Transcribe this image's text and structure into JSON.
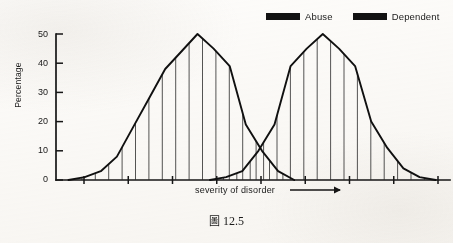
{
  "figure": {
    "caption_prefix": "圖",
    "caption_number": "12.5"
  },
  "legend": {
    "position": "top-right",
    "entries": [
      {
        "label": "Abuse",
        "color": "#121212",
        "swatch": "legend-swatch-rect"
      },
      {
        "label": "Dependent",
        "color": "#121212",
        "swatch": "legend-swatch-rect"
      }
    ]
  },
  "axes": {
    "y_title": "Percentage",
    "x_title": "severity of disorder",
    "x_arrow_icon": "right-arrow-icon",
    "y_ticks": [
      "0",
      "10",
      "20",
      "30",
      "40",
      "50"
    ]
  },
  "chart_data": {
    "type": "line",
    "title": "",
    "subtitle": "",
    "xlabel": "severity of disorder",
    "ylabel": "Percentage",
    "ylim": [
      0,
      50
    ],
    "xlim": [
      0,
      22
    ],
    "grid": false,
    "legend_position": "top-right",
    "y_ticks": [
      0,
      10,
      20,
      30,
      40,
      50
    ],
    "x_tick_count": 9,
    "x_ticks_labeled": false,
    "annotations": [
      "Two overlapping frequency polygons with vertical hatch shading",
      "Curves cross at approximately 10 percent",
      "X axis increases in severity from left to right"
    ],
    "series": [
      {
        "name": "Abuse",
        "color": "#121212",
        "fill": "vertical-hatch",
        "x": [
          0.7,
          1.6,
          2.5,
          3.4,
          4.3,
          5.2,
          6.1,
          7.0,
          7.9,
          8.8,
          9.7,
          10.6,
          11.5,
          12.4,
          13.3
        ],
        "values": [
          0,
          1,
          3,
          8,
          18,
          28,
          38,
          44,
          50,
          45,
          39,
          19,
          10,
          3,
          0
        ]
      },
      {
        "name": "Dependent",
        "color": "#121212",
        "fill": "vertical-hatch",
        "x": [
          8.6,
          9.5,
          10.4,
          11.3,
          12.2,
          13.1,
          14.0,
          14.9,
          15.8,
          16.7,
          17.6,
          18.5,
          19.4,
          20.3,
          21.2
        ],
        "values": [
          0,
          1,
          3,
          10,
          19,
          39,
          45,
          50,
          45,
          39,
          20,
          11,
          4,
          1,
          0
        ]
      }
    ]
  }
}
